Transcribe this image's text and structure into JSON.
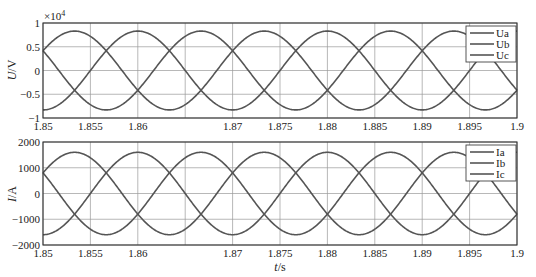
{
  "chart_data": [
    {
      "type": "line",
      "title": "",
      "xlabel": "t/s",
      "ylabel": "U/V",
      "y_multiplier_label": "×10^4",
      "y_multiplier_base": "×10",
      "y_multiplier_exp": "4",
      "xlim": [
        1.85,
        1.9
      ],
      "ylim": [
        -1,
        1
      ],
      "x_ticks": [
        1.85,
        1.855,
        1.86,
        1.865,
        1.87,
        1.875,
        1.88,
        1.885,
        1.89,
        1.895,
        1.9
      ],
      "x_tick_labels": [
        "1.85",
        "1.855",
        "1.86",
        "",
        "1.87",
        "1.875",
        "1.88",
        "1.885",
        "1.89",
        "1.895",
        "1.9"
      ],
      "y_ticks": [
        -1,
        -0.5,
        0,
        0.5,
        1
      ],
      "y_tick_labels": [
        "−1",
        "−0.5",
        "0",
        "0.5",
        "1"
      ],
      "grid": true,
      "legend_position": "top-right",
      "frequency_hz": 50,
      "series": [
        {
          "name": "Ua",
          "amplitude": 0.83,
          "phase_deg": 180
        },
        {
          "name": "Ub",
          "amplitude": 0.83,
          "phase_deg": 60
        },
        {
          "name": "Uc",
          "amplitude": 0.83,
          "phase_deg": -60
        }
      ],
      "x_start": 1.85,
      "sample_points": {
        "t": [
          1.85,
          1.8533,
          1.8567,
          1.86
        ],
        "Ua": [
          -0.83,
          0.415,
          0.415,
          -0.83
        ]
      }
    },
    {
      "type": "line",
      "title": "",
      "xlabel": "t/s",
      "ylabel": "I/A",
      "xlim": [
        1.85,
        1.9
      ],
      "ylim": [
        -2000,
        2000
      ],
      "x_ticks": [
        1.85,
        1.855,
        1.86,
        1.865,
        1.87,
        1.875,
        1.88,
        1.885,
        1.89,
        1.895,
        1.9
      ],
      "x_tick_labels": [
        "1.85",
        "1.855",
        "1.86",
        "",
        "1.87",
        "1.875",
        "1.88",
        "1.885",
        "1.89",
        "1.895",
        "1.9"
      ],
      "y_ticks": [
        -2000,
        -1000,
        0,
        1000,
        2000
      ],
      "y_tick_labels": [
        "−2000",
        "−1000",
        "0",
        "1000",
        "2000"
      ],
      "grid": true,
      "legend_position": "top-right",
      "frequency_hz": 50,
      "series": [
        {
          "name": "Ia",
          "amplitude": 1600,
          "phase_deg": 180
        },
        {
          "name": "Ib",
          "amplitude": 1600,
          "phase_deg": 60
        },
        {
          "name": "Ic",
          "amplitude": 1600,
          "phase_deg": -60
        }
      ],
      "x_start": 1.85
    }
  ],
  "labels": {
    "top_ylabel_italic": "U",
    "top_ylabel_unit": "/V",
    "bottom_ylabel_italic": "I",
    "bottom_ylabel_unit": "/A",
    "xlabel_italic": "t",
    "xlabel_unit": "/s"
  },
  "colors": {
    "curve": "#555555",
    "grid": "#9a9a9a",
    "frame": "#333333"
  }
}
